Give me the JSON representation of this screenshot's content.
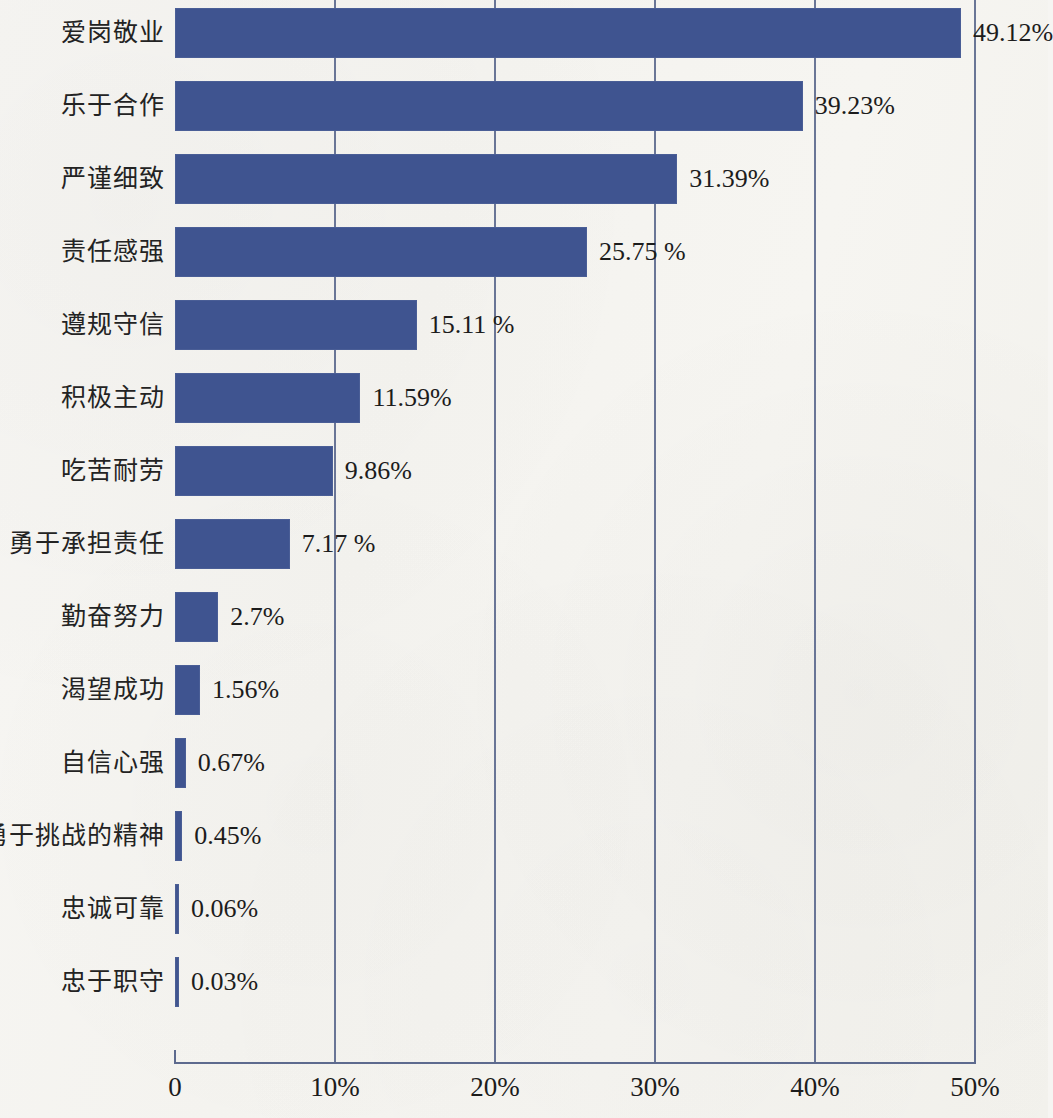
{
  "chart_data": {
    "type": "bar",
    "orientation": "horizontal",
    "title": "",
    "subtitle": "",
    "xlabel": "",
    "ylabel": "",
    "xlim": [
      0,
      50
    ],
    "grid": true,
    "legend": null,
    "unit": "%",
    "categories": [
      "爱岗敬业",
      "乐于合作",
      "严谨细致",
      "责任感强",
      "遵规守信",
      "积极主动",
      "吃苦耐劳",
      "勇于承担责任",
      "勤奋努力",
      "渴望成功",
      "自信心强",
      "勇于挑战的精神",
      "忠诚可靠",
      "忠于职守"
    ],
    "values": [
      49.12,
      39.23,
      31.39,
      25.75,
      15.11,
      11.59,
      9.86,
      7.17,
      2.7,
      1.56,
      0.67,
      0.45,
      0.06,
      0.03
    ],
    "value_labels": [
      "49.12%",
      "39.23%",
      "31.39%",
      "25.75 %",
      "15.11 %",
      "11.59%",
      "9.86%",
      "7.17 %",
      "2.7%",
      "1.56%",
      "0.67%",
      "0.45%",
      "0.06%",
      "0.03%"
    ],
    "xticks": [
      0,
      10,
      20,
      30,
      40,
      50
    ],
    "xtick_labels": [
      "0",
      "10%",
      "20%",
      "30%",
      "40%",
      "50%"
    ],
    "bar_color": "#3f5490",
    "grid_color": "#5d6a8e",
    "axis_color": "#5d6a8e",
    "background_color": "#f6f5f2",
    "text_color": "#1c1c1c"
  }
}
